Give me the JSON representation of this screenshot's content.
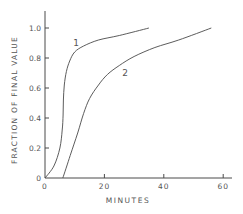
{
  "chart_data": {
    "type": "line",
    "title": "",
    "xlabel": "MINUTES",
    "ylabel": "FRACTION OF FINAL VALUE",
    "xlim": [
      0,
      62
    ],
    "ylim": [
      0,
      1.1
    ],
    "x_ticks": [
      0,
      20,
      40,
      60
    ],
    "x_tick_labels": [
      "0",
      "20",
      "40",
      "60"
    ],
    "y_ticks": [
      0,
      0.2,
      0.4,
      0.6,
      0.8,
      1.0
    ],
    "y_tick_labels": [
      "0",
      "0.2",
      "0.4",
      "0.6",
      "0.8",
      "1.0"
    ],
    "grid": false,
    "legend": "none (curves labeled inline)",
    "series": [
      {
        "name": "1",
        "label_position": {
          "x": 9.5,
          "y": 0.88
        },
        "x": [
          0,
          3,
          5,
          5.8,
          6.1,
          6.2,
          6.5,
          7.2,
          8.3,
          10,
          13,
          18,
          25,
          35
        ],
        "y": [
          0,
          0.08,
          0.2,
          0.32,
          0.42,
          0.52,
          0.62,
          0.71,
          0.78,
          0.84,
          0.88,
          0.92,
          0.95,
          1.0
        ]
      },
      {
        "name": "2",
        "label_position": {
          "x": 26,
          "y": 0.68
        },
        "x": [
          6,
          8.5,
          11,
          13,
          15,
          18,
          21,
          25,
          30,
          37,
          45,
          56
        ],
        "y": [
          0,
          0.15,
          0.3,
          0.43,
          0.53,
          0.62,
          0.69,
          0.75,
          0.81,
          0.87,
          0.92,
          1.0
        ]
      }
    ]
  },
  "labels": {
    "xlabel": "MINUTES",
    "ylabel": "FRACTION OF FINAL VALUE",
    "curve1": "1",
    "curve2": "2"
  },
  "colors": {
    "line": "#4a4a4a",
    "text": "#555555",
    "background": "#ffffff"
  }
}
